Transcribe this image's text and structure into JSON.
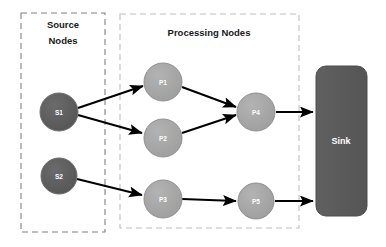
{
  "diagram": {
    "canvas": {
      "width": 386,
      "height": 247,
      "background": "#ffffff"
    },
    "colors": {
      "source_node_fill": "#595959",
      "processing_node_fill": "#a6a6a6",
      "sink_fill": "#595959",
      "node_stroke": "#7f7f7f",
      "edge": "#000000",
      "group_border_source": "#808080",
      "group_border_processing": "#bfbfbf",
      "label_text": "#1a1a1a",
      "node_text": "#ffffff"
    },
    "groups": [
      {
        "id": "source-group",
        "label_line1": "Source",
        "label_line2": "Nodes",
        "x": 21,
        "y": 13,
        "width": 84,
        "height": 219,
        "border_color": "#808080"
      },
      {
        "id": "processing-group",
        "label_line1": "Processing Nodes",
        "label_line2": "",
        "x": 120,
        "y": 14,
        "width": 179,
        "height": 214,
        "border_color": "#bfbfbf"
      }
    ],
    "nodes": [
      {
        "id": "S1",
        "label": "S1",
        "type": "source",
        "cx": 59,
        "cy": 112,
        "r": 19
      },
      {
        "id": "S2",
        "label": "S2",
        "type": "source",
        "cx": 59,
        "cy": 176,
        "r": 18
      },
      {
        "id": "P1",
        "label": "P1",
        "type": "processing",
        "cx": 163,
        "cy": 82,
        "r": 19
      },
      {
        "id": "P2",
        "label": "P2",
        "type": "processing",
        "cx": 163,
        "cy": 138,
        "r": 19
      },
      {
        "id": "P3",
        "label": "P3",
        "type": "processing",
        "cx": 163,
        "cy": 199,
        "r": 19
      },
      {
        "id": "P4",
        "label": "P4",
        "type": "processing",
        "cx": 256,
        "cy": 112,
        "r": 19
      },
      {
        "id": "P5",
        "label": "P5",
        "type": "processing",
        "cx": 256,
        "cy": 201,
        "r": 18
      }
    ],
    "sink": {
      "id": "Sink",
      "label": "Sink",
      "x": 316,
      "y": 66,
      "width": 51,
      "height": 150,
      "radius": 10
    },
    "edges": [
      {
        "from": "S1",
        "to": "P1",
        "x1": 78,
        "y1": 108,
        "x2": 145,
        "y2": 87
      },
      {
        "from": "S1",
        "to": "P2",
        "x1": 78,
        "y1": 115,
        "x2": 144,
        "y2": 134
      },
      {
        "from": "S2",
        "to": "P3",
        "x1": 77,
        "y1": 179,
        "x2": 144,
        "y2": 196
      },
      {
        "from": "P1",
        "to": "P4",
        "x1": 182,
        "y1": 87,
        "x2": 238,
        "y2": 108
      },
      {
        "from": "P2",
        "to": "P4",
        "x1": 182,
        "y1": 133,
        "x2": 238,
        "y2": 114
      },
      {
        "from": "P3",
        "to": "P5",
        "x1": 182,
        "y1": 199,
        "x2": 238,
        "y2": 201
      },
      {
        "from": "P4",
        "to": "Sink",
        "x1": 276,
        "y1": 112,
        "x2": 315,
        "y2": 112
      },
      {
        "from": "P5",
        "to": "Sink",
        "x1": 275,
        "y1": 201,
        "x2": 315,
        "y2": 201
      }
    ]
  }
}
